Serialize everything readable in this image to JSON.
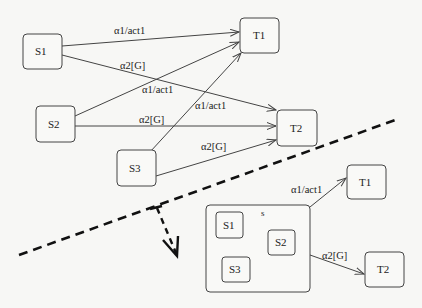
{
  "diagram": {
    "top": {
      "nodes": {
        "s1": "S1",
        "s2": "S2",
        "s3": "S3",
        "t1": "T1",
        "t2": "T2"
      },
      "edges": [
        {
          "from": "S1",
          "to": "T1",
          "label": "α1/act1"
        },
        {
          "from": "S1",
          "to": "T2",
          "label": "α2[G]"
        },
        {
          "from": "S2",
          "to": "T1",
          "label": "α1/act1"
        },
        {
          "from": "S2",
          "to": "T2",
          "label": "α2[G]"
        },
        {
          "from": "S3",
          "to": "T1",
          "label": "α1/act1"
        },
        {
          "from": "S3",
          "to": "T2",
          "label": "α2[G]"
        }
      ]
    },
    "bottom": {
      "superstate": "s",
      "inner_nodes": {
        "s1": "S1",
        "s2": "S2",
        "s3": "S3"
      },
      "targets": {
        "t1": "T1",
        "t2": "T2"
      },
      "edges": [
        {
          "from": "s",
          "to": "T1",
          "label": "α1/act1"
        },
        {
          "from": "s",
          "to": "T2",
          "label": "α2[G]"
        }
      ]
    },
    "transformation_arrow": "dashed-transformation-arrow"
  }
}
